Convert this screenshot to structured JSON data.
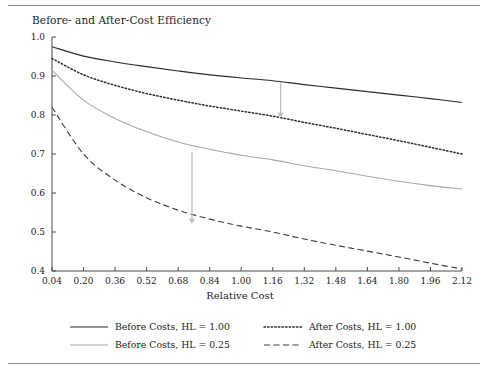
{
  "chart_data": {
    "type": "line",
    "title": "Before- and After-Cost Efficiency",
    "xlabel": "Relative Cost",
    "ylabel": "",
    "xlim": [
      0.04,
      2.12
    ],
    "ylim": [
      0.4,
      1.0
    ],
    "grid": false,
    "legend_position": "bottom",
    "xticks": [
      "0.04",
      "0.20",
      "0.36",
      "0.52",
      "0.68",
      "0.84",
      "1.00",
      "1.16",
      "1.32",
      "1.48",
      "1.64",
      "1.80",
      "1.96",
      "2.12"
    ],
    "xtick_values": [
      0.04,
      0.2,
      0.36,
      0.52,
      0.68,
      0.84,
      1.0,
      1.16,
      1.32,
      1.48,
      1.64,
      1.8,
      1.96,
      2.12
    ],
    "yticks": [
      "0.4",
      "0.5",
      "0.6",
      "0.7",
      "0.8",
      "0.9",
      "1.0"
    ],
    "ytick_values": [
      0.4,
      0.5,
      0.6,
      0.7,
      0.8,
      0.9,
      1.0
    ],
    "x": [
      0.04,
      0.2,
      0.36,
      0.52,
      0.68,
      0.84,
      1.0,
      1.16,
      1.32,
      1.48,
      1.64,
      1.8,
      1.96,
      2.12
    ],
    "series": [
      {
        "name": "Before Costs, HL = 1.00",
        "style": "solid",
        "color": "#2b2b2b",
        "values": [
          0.975,
          0.951,
          0.936,
          0.924,
          0.913,
          0.903,
          0.895,
          0.888,
          0.878,
          0.869,
          0.86,
          0.851,
          0.842,
          0.832
        ]
      },
      {
        "name": "After Costs, HL = 1.00",
        "style": "dotted",
        "color": "#2b2b2b",
        "values": [
          0.945,
          0.903,
          0.876,
          0.855,
          0.838,
          0.823,
          0.81,
          0.797,
          0.781,
          0.766,
          0.75,
          0.734,
          0.717,
          0.7
        ]
      },
      {
        "name": "Before Costs, HL = 0.25",
        "style": "solid",
        "color": "#a8a8a8",
        "values": [
          0.915,
          0.838,
          0.791,
          0.757,
          0.731,
          0.712,
          0.697,
          0.685,
          0.67,
          0.657,
          0.643,
          0.63,
          0.619,
          0.61
        ]
      },
      {
        "name": "After Costs, HL = 0.25",
        "style": "dashed",
        "color": "#3a3a3a",
        "values": [
          0.82,
          0.7,
          0.633,
          0.588,
          0.556,
          0.533,
          0.515,
          0.5,
          0.482,
          0.466,
          0.451,
          0.436,
          0.42,
          0.405
        ]
      }
    ],
    "annotations": [
      {
        "name": "arrow-hl-100",
        "x": 1.2,
        "y_from": 0.885,
        "y_to": 0.793,
        "color": "#bfbfbf"
      },
      {
        "name": "arrow-hl-025",
        "x": 0.75,
        "y_from": 0.705,
        "y_to": 0.521,
        "color": "#bfbfbf"
      }
    ],
    "legend": [
      {
        "label": "Before Costs, HL = 1.00",
        "style": "solid",
        "color": "#2b2b2b"
      },
      {
        "label": "After Costs, HL = 1.00",
        "style": "dotted",
        "color": "#2b2b2b"
      },
      {
        "label": "Before Costs, HL = 0.25",
        "style": "solid",
        "color": "#a8a8a8"
      },
      {
        "label": "After Costs, HL = 0.25",
        "style": "dashed",
        "color": "#3a3a3a"
      }
    ]
  }
}
